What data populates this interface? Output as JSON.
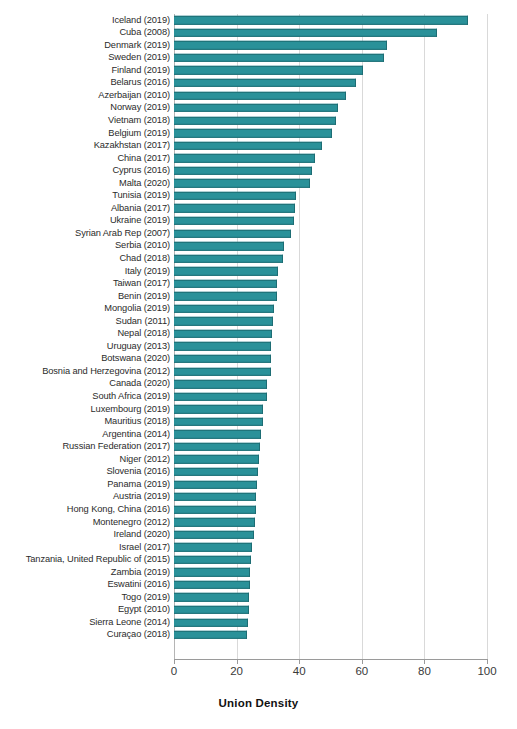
{
  "chart_data": {
    "type": "bar",
    "orientation": "horizontal",
    "title": "",
    "xlabel": "Union Density",
    "ylabel": "",
    "xlim": [
      0,
      100
    ],
    "xticks": [
      0,
      20,
      40,
      60,
      80,
      100
    ],
    "xtick_labels": [
      "0",
      "20",
      "40",
      "60",
      "80",
      "100"
    ],
    "grid": true,
    "grid_axis": "x",
    "legend": false,
    "bar_color": "#2a9199",
    "bar_edge_color": "#1d6d74",
    "categories": [
      "Iceland (2019)",
      "Cuba (2008)",
      "Denmark (2019)",
      "Sweden (2019)",
      "Finland (2019)",
      "Belarus (2016)",
      "Azerbaijan (2010)",
      "Norway (2019)",
      "Vietnam (2018)",
      "Belgium (2019)",
      "Kazakhstan (2017)",
      "China (2017)",
      "Cyprus (2016)",
      "Malta (2020)",
      "Tunisia (2019)",
      "Albania (2017)",
      "Ukraine (2019)",
      "Syrian Arab Rep (2007)",
      "Serbia (2010)",
      "Chad (2018)",
      "Italy (2019)",
      "Taiwan (2017)",
      "Benin (2019)",
      "Mongolia (2019)",
      "Sudan (2011)",
      "Nepal (2018)",
      "Uruguay (2013)",
      "Botswana (2020)",
      "Bosnia and Herzegovina (2012)",
      "Canada (2020)",
      "South Africa (2019)",
      "Luxembourg (2019)",
      "Mauritius (2018)",
      "Argentina (2014)",
      "Russian Federation (2017)",
      "Niger (2012)",
      "Slovenia (2016)",
      "Panama (2019)",
      "Austria (2019)",
      "Hong Kong, China (2016)",
      "Montenegro (2012)",
      "Ireland (2020)",
      "Israel (2017)",
      "Tanzania, United Republic of (2015)",
      "Zambia (2019)",
      "Eswatini (2016)",
      "Togo (2019)",
      "Egypt (2010)",
      "Sierra Leone (2014)",
      "Curaçao (2018)"
    ],
    "values": [
      93.8,
      83.9,
      68.0,
      67.1,
      60.4,
      58.3,
      54.9,
      52.5,
      51.7,
      50.4,
      47.2,
      45.1,
      44.2,
      43.3,
      39.1,
      38.5,
      38.2,
      37.4,
      35.0,
      34.7,
      33.3,
      33.0,
      32.8,
      31.8,
      31.6,
      31.3,
      31.1,
      31.0,
      30.9,
      29.8,
      29.6,
      28.5,
      28.3,
      27.7,
      27.5,
      27.3,
      26.9,
      26.6,
      26.3,
      26.2,
      25.8,
      25.4,
      25.0,
      24.6,
      24.4,
      24.3,
      24.1,
      23.9,
      23.7,
      23.4
    ]
  }
}
